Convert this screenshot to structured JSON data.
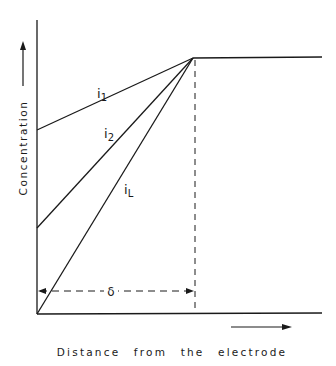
{
  "diagram": {
    "y_axis_label": "Concentration",
    "x_axis_label": "Distance from the electrode",
    "curves": [
      {
        "name": "i1",
        "label_main": "i",
        "label_sub": "1"
      },
      {
        "name": "i2",
        "label_main": "i",
        "label_sub": "2"
      },
      {
        "name": "iL",
        "label_main": "i",
        "label_sub": "L"
      }
    ],
    "diffusion_layer_label": "δ",
    "line_color": "#1a1a1a"
  }
}
